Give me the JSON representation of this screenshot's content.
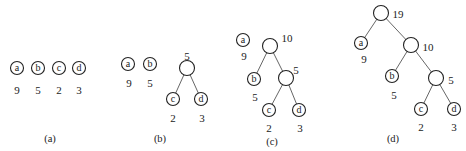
{
  "diagram": {
    "type": "huffman-tree-construction",
    "panels": [
      {
        "caption": "(a)",
        "leaves": [
          {
            "label": "a",
            "weight": "9",
            "x": 17,
            "y": 68,
            "wx": 17,
            "wy": 91
          },
          {
            "label": "b",
            "weight": "5",
            "x": 38,
            "y": 68,
            "wx": 38,
            "wy": 91
          },
          {
            "label": "c",
            "weight": "2",
            "x": 59,
            "y": 68,
            "wx": 59,
            "wy": 91
          },
          {
            "label": "d",
            "weight": "3",
            "x": 79,
            "y": 68,
            "wx": 79,
            "wy": 91
          }
        ],
        "internal": [],
        "edges": [],
        "cap_x": 50,
        "cap_y": 140
      },
      {
        "caption": "(b)",
        "leaves": [
          {
            "label": "a",
            "weight": "9",
            "x": 128,
            "y": 64,
            "wx": 129,
            "wy": 84
          },
          {
            "label": "b",
            "weight": "5",
            "x": 150,
            "y": 64,
            "wx": 150,
            "wy": 84
          },
          {
            "label": "c",
            "weight": "2",
            "x": 173,
            "y": 99,
            "wx": 173,
            "wy": 119
          },
          {
            "label": "d",
            "weight": "3",
            "x": 201,
            "y": 99,
            "wx": 202,
            "wy": 119
          }
        ],
        "internal": [
          {
            "id": "n5",
            "weight": "5",
            "x": 187,
            "y": 68,
            "wx": 187,
            "wy": 57
          }
        ],
        "edges": [
          [
            187,
            68,
            173,
            99
          ],
          [
            187,
            68,
            201,
            99
          ]
        ],
        "cap_x": 160,
        "cap_y": 140
      },
      {
        "caption": "(c)",
        "leaves": [
          {
            "label": "a",
            "weight": "9",
            "x": 243,
            "y": 40,
            "wx": 244,
            "wy": 57
          },
          {
            "label": "b",
            "weight": "5",
            "x": 254,
            "y": 79,
            "wx": 255,
            "wy": 98
          },
          {
            "label": "c",
            "weight": "2",
            "x": 269,
            "y": 110,
            "wx": 269,
            "wy": 129
          },
          {
            "label": "d",
            "weight": "3",
            "x": 299,
            "y": 110,
            "wx": 300,
            "wy": 129
          }
        ],
        "internal": [
          {
            "id": "n10",
            "weight": "10",
            "x": 270,
            "y": 46,
            "wx": 287,
            "wy": 39
          },
          {
            "id": "n5",
            "weight": "5",
            "x": 286,
            "y": 78,
            "wx": 296,
            "wy": 71
          }
        ],
        "edges": [
          [
            270,
            46,
            254,
            79
          ],
          [
            270,
            46,
            286,
            78
          ],
          [
            286,
            78,
            269,
            110
          ],
          [
            286,
            78,
            299,
            110
          ]
        ],
        "cap_x": 272,
        "cap_y": 143
      },
      {
        "caption": "(d)",
        "leaves": [
          {
            "label": "a",
            "weight": "9",
            "x": 361,
            "y": 43,
            "wx": 364,
            "wy": 60
          },
          {
            "label": "b",
            "weight": "5",
            "x": 392,
            "y": 76,
            "wx": 394,
            "wy": 96
          },
          {
            "label": "c",
            "weight": "2",
            "x": 421,
            "y": 109,
            "wx": 421,
            "wy": 128
          },
          {
            "label": "d",
            "weight": "3",
            "x": 454,
            "y": 109,
            "wx": 454,
            "wy": 128
          }
        ],
        "internal": [
          {
            "id": "n19",
            "weight": "19",
            "x": 381,
            "y": 13,
            "wx": 398,
            "wy": 15
          },
          {
            "id": "n10",
            "weight": "10",
            "x": 411,
            "y": 45,
            "wx": 428,
            "wy": 48
          },
          {
            "id": "n5",
            "weight": "5",
            "x": 436,
            "y": 78,
            "wx": 451,
            "wy": 81
          }
        ],
        "edges": [
          [
            381,
            13,
            361,
            43
          ],
          [
            381,
            13,
            411,
            45
          ],
          [
            411,
            45,
            392,
            76
          ],
          [
            411,
            45,
            436,
            78
          ],
          [
            436,
            78,
            421,
            109
          ],
          [
            436,
            78,
            454,
            109
          ]
        ],
        "cap_x": 393,
        "cap_y": 140
      }
    ],
    "leaf_radius": 6.5,
    "internal_radius": 7.5
  }
}
